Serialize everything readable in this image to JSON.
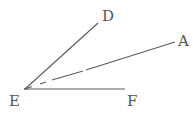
{
  "diagram": {
    "type": "geometry-angles",
    "vertex": {
      "label": "E",
      "x": 25,
      "y": 89
    },
    "rays": [
      {
        "name": "ED",
        "label": "D",
        "end": {
          "x": 98,
          "y": 23
        },
        "style": "solid"
      },
      {
        "name": "EA",
        "label": "A",
        "end": {
          "x": 175,
          "y": 42
        },
        "style": "broken"
      },
      {
        "name": "EF",
        "label": "F",
        "end": {
          "x": 125,
          "y": 89
        },
        "style": "solid"
      }
    ],
    "labels": {
      "E": "E",
      "D": "D",
      "A": "A",
      "F": "F"
    },
    "stroke_color": "#5a5a5a",
    "label_color": "#555555"
  }
}
